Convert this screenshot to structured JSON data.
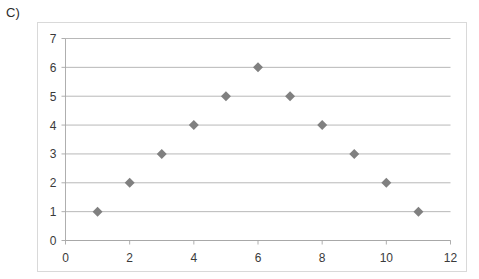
{
  "figure": {
    "label": "C)"
  },
  "colors": {
    "marker": "#808080",
    "gridline": "#a6a6a6",
    "axis": "#a6a6a6",
    "border": "#d9d9d9",
    "text": "#3a3a3a",
    "background": "#ffffff"
  },
  "chart_data": {
    "type": "scatter",
    "title": "",
    "subtitle": "",
    "xlabel": "",
    "ylabel": "",
    "xlim": [
      0,
      12
    ],
    "ylim": [
      0,
      7
    ],
    "xticks": [
      0,
      2,
      4,
      6,
      8,
      10,
      12
    ],
    "yticks": [
      0,
      1,
      2,
      3,
      4,
      5,
      6,
      7
    ],
    "xtick_labels": [
      "0",
      "2",
      "4",
      "6",
      "8",
      "10",
      "12"
    ],
    "ytick_labels": [
      "0",
      "1",
      "2",
      "3",
      "4",
      "5",
      "6",
      "7"
    ],
    "grid": "horizontal",
    "legend": "none",
    "marker_shape": "diamond",
    "series": [
      {
        "name": "series-1",
        "x": [
          1,
          2,
          3,
          4,
          5,
          6,
          7,
          8,
          9,
          10,
          11
        ],
        "y": [
          1,
          2,
          3,
          4,
          5,
          6,
          5,
          4,
          3,
          2,
          1
        ],
        "points": [
          {
            "x": 1,
            "y": 1
          },
          {
            "x": 2,
            "y": 2
          },
          {
            "x": 3,
            "y": 3
          },
          {
            "x": 4,
            "y": 4
          },
          {
            "x": 5,
            "y": 5
          },
          {
            "x": 6,
            "y": 6
          },
          {
            "x": 7,
            "y": 5
          },
          {
            "x": 8,
            "y": 4
          },
          {
            "x": 9,
            "y": 3
          },
          {
            "x": 10,
            "y": 2
          },
          {
            "x": 11,
            "y": 1
          }
        ]
      }
    ]
  }
}
